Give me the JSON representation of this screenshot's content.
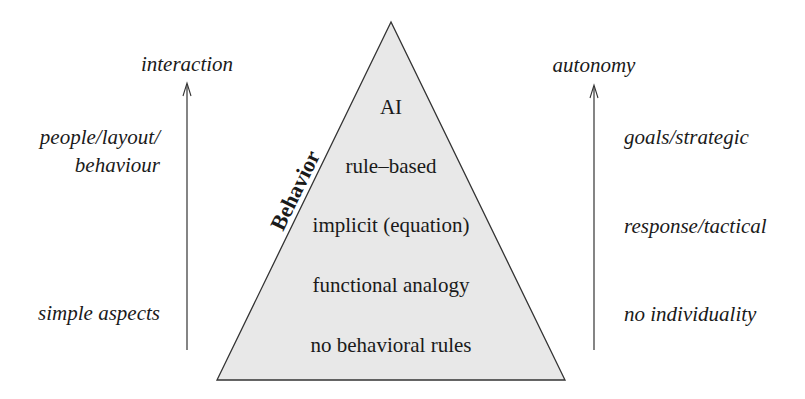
{
  "diagram": {
    "pyramid": {
      "fill": "#e8e8e8",
      "stroke": "#333333",
      "side_label": "Behavior",
      "levels": [
        {
          "label": "AI"
        },
        {
          "label": "rule–based"
        },
        {
          "label": "implicit (equation)"
        },
        {
          "label": "functional analogy"
        },
        {
          "label": "no behavioral rules"
        }
      ]
    },
    "left_axis": {
      "title": "interaction",
      "labels": [
        {
          "line1": "people/layout/",
          "line2": "behaviour"
        },
        {
          "line1": "simple aspects"
        }
      ]
    },
    "right_axis": {
      "title": "autonomy",
      "labels": [
        {
          "line1": "goals/strategic"
        },
        {
          "line1": "response/tactical"
        },
        {
          "line1": "no individuality"
        }
      ]
    }
  }
}
